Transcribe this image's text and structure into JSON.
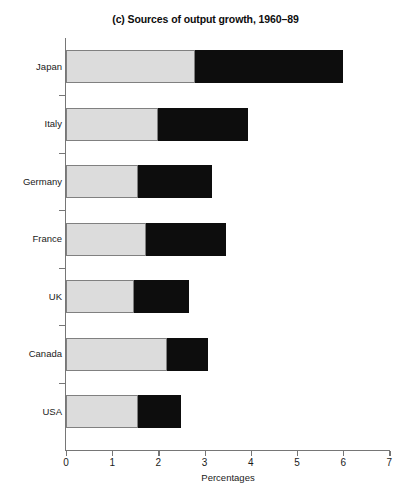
{
  "chart_data": {
    "type": "bar",
    "orientation": "horizontal",
    "stacked": true,
    "title": "(c) Sources of output growth, 1960–89",
    "xlabel": "Percentages",
    "ylabel": "",
    "xlim": [
      0,
      7
    ],
    "xticks": [
      0,
      1,
      2,
      3,
      4,
      5,
      6,
      7
    ],
    "xtick_labels": [
      "0",
      "1",
      "2",
      "3",
      "4",
      "5",
      "6",
      "7"
    ],
    "grid": false,
    "legend": "none",
    "categories": [
      "Japan",
      "Italy",
      "Germany",
      "France",
      "UK",
      "Canada",
      "USA"
    ],
    "series": [
      {
        "name": "segment-1",
        "color": "#dcdcdc",
        "values": [
          2.79,
          2.0,
          1.55,
          1.73,
          1.47,
          2.19,
          1.56
        ]
      },
      {
        "name": "segment-2",
        "color": "#0d0d0d",
        "values": [
          3.21,
          1.95,
          1.6,
          1.73,
          1.19,
          0.88,
          0.93
        ]
      }
    ],
    "totals": [
      6.0,
      3.95,
      3.15,
      3.46,
      2.66,
      3.07,
      2.49
    ]
  },
  "colors": {
    "segment_light": "#dcdcdc",
    "segment_dark": "#0d0d0d",
    "axis": "#767676",
    "bar_outline": "#808080",
    "background": "#ffffff",
    "text": "#1a1a1a"
  }
}
